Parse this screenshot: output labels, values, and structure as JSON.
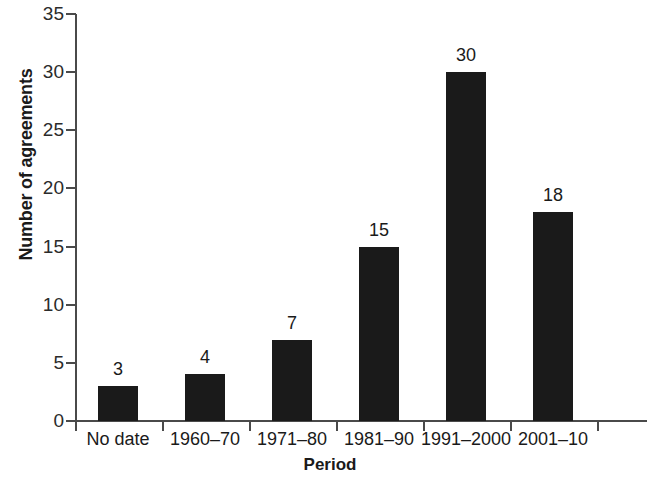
{
  "chart_data": {
    "type": "bar",
    "title": "",
    "subtitle": "",
    "xlabel": "Period",
    "ylabel": "Number of agreements",
    "categories": [
      "No date",
      "1960–70",
      "1971–80",
      "1981–90",
      "1991–2000",
      "2001–10"
    ],
    "values": [
      3,
      4,
      7,
      15,
      30,
      18
    ],
    "data_labels": [
      "3",
      "4",
      "7",
      "15",
      "30",
      "18"
    ],
    "ylim": [
      0,
      35
    ],
    "y_ticks": [
      0,
      5,
      10,
      15,
      20,
      25,
      30,
      35
    ],
    "y_tick_labels": [
      "0",
      "5",
      "10",
      "15",
      "20",
      "25",
      "30",
      "35"
    ],
    "grid": false,
    "legend": null,
    "bar_color": "#1a1a1a",
    "axis_color": "#4a4a4a",
    "background": "#ffffff"
  }
}
